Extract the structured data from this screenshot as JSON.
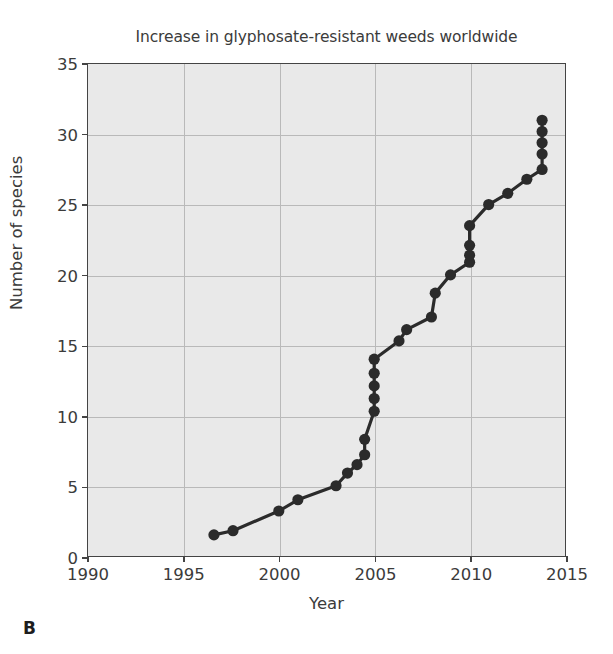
{
  "panel": {
    "label": "B"
  },
  "chart_data": {
    "type": "line",
    "title": "Increase in glyphosate-resistant weeds worldwide",
    "xlabel": "Year",
    "ylabel": "Number of species",
    "xlim": [
      1990,
      2015
    ],
    "ylim": [
      0,
      35
    ],
    "xticks": [
      1990,
      1995,
      2000,
      2005,
      2010,
      2015
    ],
    "yticks": [
      0,
      5,
      10,
      15,
      20,
      25,
      30,
      35
    ],
    "xtick_labels": [
      "1990",
      "1995",
      "2000",
      "2005",
      "2010",
      "2015"
    ],
    "ytick_labels": [
      "0",
      "5",
      "10",
      "15",
      "20",
      "25",
      "30",
      "35"
    ],
    "grid": true,
    "legend": "none",
    "marker": "filled-circle",
    "marker_color": "#2b2b2b",
    "line_color": "#2b2b2b",
    "plot_background": "#e9e9e9",
    "gridline_color": "#b9b9b9",
    "axis_color": "#444444",
    "series": [
      {
        "name": "Glyphosate-resistant weed species",
        "x": [
          1996.6,
          1997.6,
          2000.0,
          2001.0,
          2003.0,
          2003.6,
          2004.1,
          2004.5,
          2004.5,
          2005.0,
          2005.0,
          2005.0,
          2005.0,
          2005.0,
          2006.3,
          2006.7,
          2008.0,
          2008.2,
          2009.0,
          2010.0,
          2010.0,
          2010.0,
          2010.0,
          2011.0,
          2012.0,
          2013.0,
          2013.8,
          2013.8,
          2013.8,
          2013.8,
          2013.8
        ],
        "y": [
          1.5,
          1.8,
          3.2,
          4.0,
          5.0,
          5.9,
          6.5,
          7.2,
          8.3,
          10.3,
          11.2,
          12.1,
          13.0,
          14.0,
          15.3,
          16.1,
          17.0,
          18.7,
          20.0,
          20.9,
          21.4,
          22.1,
          23.5,
          25.0,
          25.8,
          26.8,
          27.5,
          28.6,
          29.4,
          30.2,
          31.0
        ]
      }
    ]
  }
}
